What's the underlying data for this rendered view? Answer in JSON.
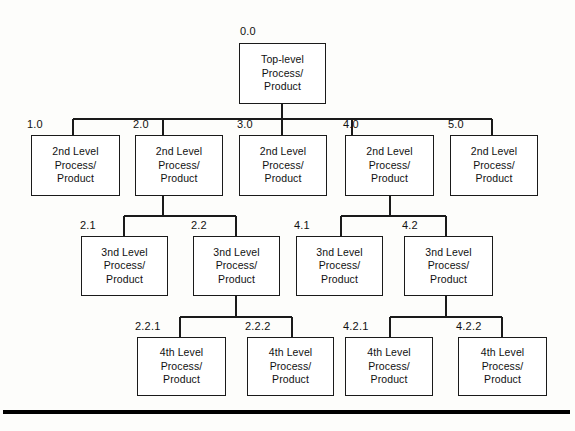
{
  "diagram": {
    "type": "hierarchy-tree",
    "line_color": "#1a1a1a",
    "box_fill": "#ffffff",
    "background": "#fdfdfb",
    "levels": 4
  },
  "nodes": [
    {
      "id": "0.0",
      "number": "0.0",
      "line1": "Top-level",
      "line2": "Process/",
      "line3": "Product",
      "level": 0,
      "x": 239,
      "y": 43,
      "w": 87,
      "h": 61,
      "label_x": 240,
      "label_y": 25
    },
    {
      "id": "1.0",
      "number": "1.0",
      "line1": "2nd Level",
      "line2": "Process/",
      "line3": "Product",
      "level": 1,
      "x": 31,
      "y": 135,
      "w": 89,
      "h": 61,
      "label_x": 27,
      "label_y": 118
    },
    {
      "id": "2.0",
      "number": "2.0",
      "line1": "2nd Level",
      "line2": "Process/",
      "line3": "Product",
      "level": 1,
      "x": 135,
      "y": 135,
      "w": 88,
      "h": 61,
      "label_x": 133,
      "label_y": 118
    },
    {
      "id": "3.0",
      "number": "3.0",
      "line1": "2nd Level",
      "line2": "Process/",
      "line3": "Product",
      "level": 1,
      "x": 239,
      "y": 135,
      "w": 88,
      "h": 61,
      "label_x": 237,
      "label_y": 118
    },
    {
      "id": "4.0",
      "number": "4.0",
      "line1": "2nd Level",
      "line2": "Process/",
      "line3": "Product",
      "level": 1,
      "x": 345,
      "y": 135,
      "w": 89,
      "h": 61,
      "label_x": 343,
      "label_y": 118
    },
    {
      "id": "5.0",
      "number": "5.0",
      "line1": "2nd Level",
      "line2": "Process/",
      "line3": "Product",
      "level": 1,
      "x": 450,
      "y": 135,
      "w": 88,
      "h": 61,
      "label_x": 448,
      "label_y": 118
    },
    {
      "id": "2.1",
      "number": "2.1",
      "line1": "3nd Level",
      "line2": "Process/",
      "line3": "Product",
      "level": 2,
      "x": 81,
      "y": 236,
      "w": 87,
      "h": 60,
      "label_x": 80,
      "label_y": 219
    },
    {
      "id": "2.2",
      "number": "2.2",
      "line1": "3nd Level",
      "line2": "Process/",
      "line3": "Product",
      "level": 2,
      "x": 193,
      "y": 236,
      "w": 87,
      "h": 60,
      "label_x": 191,
      "label_y": 219
    },
    {
      "id": "4.1",
      "number": "4.1",
      "line1": "3nd Level",
      "line2": "Process/",
      "line3": "Product",
      "level": 2,
      "x": 296,
      "y": 236,
      "w": 87,
      "h": 60,
      "label_x": 294,
      "label_y": 219
    },
    {
      "id": "4.2",
      "number": "4.2",
      "line1": "3nd Level",
      "line2": "Process/",
      "line3": "Product",
      "level": 2,
      "x": 404,
      "y": 236,
      "w": 89,
      "h": 60,
      "label_x": 402,
      "label_y": 219
    },
    {
      "id": "2.2.1",
      "number": "2.2.1",
      "line1": "4th Level",
      "line2": "Process/",
      "line3": "Product",
      "level": 3,
      "x": 137,
      "y": 337,
      "w": 89,
      "h": 59,
      "label_x": 135,
      "label_y": 320
    },
    {
      "id": "2.2.2",
      "number": "2.2.2",
      "line1": "4th Level",
      "line2": "Process/",
      "line3": "Product",
      "level": 3,
      "x": 247,
      "y": 337,
      "w": 87,
      "h": 59,
      "label_x": 245,
      "label_y": 320
    },
    {
      "id": "4.2.1",
      "number": "4.2.1",
      "line1": "4th Level",
      "line2": "Process/",
      "line3": "Product",
      "level": 3,
      "x": 345,
      "y": 337,
      "w": 88,
      "h": 59,
      "label_x": 343,
      "label_y": 320
    },
    {
      "id": "4.2.2",
      "number": "4.2.2",
      "line1": "4th Level",
      "line2": "Process/",
      "line3": "Product",
      "level": 3,
      "x": 458,
      "y": 337,
      "w": 89,
      "h": 59,
      "label_x": 456,
      "label_y": 320
    }
  ],
  "connectors": {
    "trunk_top": {
      "x": 282,
      "y1": 104,
      "y2": 119
    },
    "bus_level1": {
      "y": 119,
      "x1": 73,
      "x2": 492
    },
    "drops_level1": [
      {
        "x": 73,
        "y1": 119,
        "y2": 135
      },
      {
        "x": 163,
        "y1": 119,
        "y2": 135
      },
      {
        "x": 282,
        "y1": 119,
        "y2": 135
      },
      {
        "x": 352,
        "y1": 119,
        "y2": 135
      },
      {
        "x": 492,
        "y1": 119,
        "y2": 135
      }
    ],
    "subtree_2": {
      "stem": {
        "x": 163,
        "y1": 196,
        "y2": 216
      },
      "bus": {
        "y": 216,
        "x1": 124,
        "x2": 236
      },
      "drops": [
        {
          "x": 124,
          "y1": 216,
          "y2": 236
        },
        {
          "x": 236,
          "y1": 216,
          "y2": 236
        }
      ]
    },
    "subtree_4": {
      "stem": {
        "x": 390,
        "y1": 196,
        "y2": 216
      },
      "bus": {
        "y": 216,
        "x1": 341,
        "x2": 446
      },
      "drops": [
        {
          "x": 341,
          "y1": 216,
          "y2": 236
        },
        {
          "x": 446,
          "y1": 216,
          "y2": 236
        }
      ]
    },
    "subtree_22": {
      "stem": {
        "x": 236,
        "y1": 296,
        "y2": 317
      },
      "bus": {
        "y": 317,
        "x1": 180,
        "x2": 292
      },
      "drops": [
        {
          "x": 180,
          "y1": 317,
          "y2": 337
        },
        {
          "x": 292,
          "y1": 317,
          "y2": 337
        }
      ]
    },
    "subtree_42": {
      "stem": {
        "x": 446,
        "y1": 296,
        "y2": 317
      },
      "bus": {
        "y": 317,
        "x1": 390,
        "x2": 502
      },
      "drops": [
        {
          "x": 390,
          "y1": 317,
          "y2": 337
        },
        {
          "x": 502,
          "y1": 317,
          "y2": 337
        }
      ]
    }
  },
  "bottom_rule": {
    "x": 3,
    "y": 410,
    "w": 567,
    "h": 4,
    "color": "#000000"
  }
}
